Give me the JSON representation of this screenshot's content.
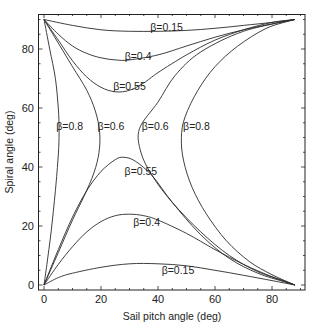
{
  "chart_data": {
    "type": "line",
    "title": "",
    "xlabel": "Sail pitch angle (deg)",
    "ylabel": "Spiral angle (deg)",
    "xlim": [
      0,
      90
    ],
    "ylim": [
      0,
      90
    ],
    "xticks": [
      0,
      20,
      40,
      60,
      80
    ],
    "yticks": [
      0,
      20,
      40,
      60,
      80
    ],
    "grid": false,
    "legend": "inline curve labels",
    "series": [
      {
        "name": "β=0.15 (upper)",
        "points": [
          [
            0,
            90
          ],
          [
            10,
            88
          ],
          [
            20,
            86.5
          ],
          [
            30,
            86
          ],
          [
            40,
            86
          ],
          [
            50,
            86.3
          ],
          [
            60,
            87
          ],
          [
            70,
            88
          ],
          [
            80,
            89
          ],
          [
            88,
            90
          ]
        ]
      },
      {
        "name": "β=0.4 (upper)",
        "points": [
          [
            0,
            90
          ],
          [
            5,
            85
          ],
          [
            10,
            81
          ],
          [
            15,
            78.5
          ],
          [
            20,
            77
          ],
          [
            25,
            76.3
          ],
          [
            30,
            76.3
          ],
          [
            40,
            78
          ],
          [
            50,
            81
          ],
          [
            60,
            84
          ],
          [
            70,
            86.5
          ],
          [
            80,
            88.5
          ],
          [
            88,
            90
          ]
        ]
      },
      {
        "name": "β=0.55 (upper)",
        "points": [
          [
            0,
            90
          ],
          [
            5,
            83
          ],
          [
            10,
            76
          ],
          [
            15,
            70.5
          ],
          [
            20,
            67
          ],
          [
            25,
            65.5
          ],
          [
            30,
            66
          ],
          [
            35,
            68.5
          ],
          [
            40,
            72
          ],
          [
            50,
            78
          ],
          [
            60,
            83
          ],
          [
            70,
            86.5
          ],
          [
            80,
            89
          ],
          [
            88,
            90
          ]
        ]
      },
      {
        "name": "β=0.6 (left)",
        "points": [
          [
            0,
            90
          ],
          [
            5,
            82
          ],
          [
            10,
            74
          ],
          [
            15,
            66
          ],
          [
            18,
            59
          ],
          [
            19.5,
            52
          ],
          [
            19.3,
            45
          ],
          [
            17.5,
            38
          ],
          [
            14,
            30
          ],
          [
            10,
            22
          ],
          [
            5,
            11
          ],
          [
            0,
            0
          ]
        ]
      },
      {
        "name": "β=0.8 (left)",
        "points": [
          [
            0,
            90
          ],
          [
            2,
            80
          ],
          [
            4,
            70
          ],
          [
            5,
            60
          ],
          [
            5.3,
            52
          ],
          [
            5,
            44
          ],
          [
            4,
            32
          ],
          [
            2.5,
            18
          ],
          [
            1,
            7
          ],
          [
            0,
            0
          ]
        ]
      },
      {
        "name": "β=0.6 (right)",
        "points": [
          [
            88,
            90
          ],
          [
            70,
            86
          ],
          [
            55,
            79
          ],
          [
            46,
            71
          ],
          [
            40,
            62
          ],
          [
            33.5,
            53
          ],
          [
            34,
            45
          ],
          [
            38,
            37
          ],
          [
            45,
            28
          ],
          [
            55,
            18
          ],
          [
            65,
            10
          ],
          [
            75,
            4.5
          ],
          [
            84,
            1.5
          ],
          [
            88,
            0
          ]
        ]
      },
      {
        "name": "β=0.8 (right)",
        "points": [
          [
            88,
            90
          ],
          [
            78,
            87
          ],
          [
            68,
            81
          ],
          [
            60,
            74
          ],
          [
            54,
            66
          ],
          [
            49.5,
            57
          ],
          [
            48.2,
            50
          ],
          [
            49,
            42
          ],
          [
            52,
            33
          ],
          [
            57,
            24
          ],
          [
            64,
            15
          ],
          [
            72,
            8
          ],
          [
            80,
            3.5
          ],
          [
            88,
            0
          ]
        ]
      },
      {
        "name": "β=0.55 (lower)",
        "points": [
          [
            0,
            0
          ],
          [
            5,
            12
          ],
          [
            10,
            23
          ],
          [
            15,
            32
          ],
          [
            20,
            38.5
          ],
          [
            25,
            42.5
          ],
          [
            28,
            43.3
          ],
          [
            32,
            42
          ],
          [
            38,
            37
          ],
          [
            45,
            28
          ],
          [
            55,
            17
          ],
          [
            65,
            9
          ],
          [
            75,
            4
          ],
          [
            84,
            1.2
          ],
          [
            88,
            0
          ]
        ]
      },
      {
        "name": "β=0.4 (lower)",
        "points": [
          [
            0,
            0
          ],
          [
            5,
            7
          ],
          [
            10,
            13
          ],
          [
            15,
            18
          ],
          [
            20,
            21.5
          ],
          [
            25,
            23.5
          ],
          [
            30,
            24
          ],
          [
            35,
            23.5
          ],
          [
            40,
            22
          ],
          [
            50,
            17.5
          ],
          [
            60,
            12
          ],
          [
            70,
            7
          ],
          [
            80,
            2.8
          ],
          [
            88,
            0
          ]
        ]
      },
      {
        "name": "β=0.15 (lower)",
        "points": [
          [
            0,
            0
          ],
          [
            5,
            2.5
          ],
          [
            10,
            4
          ],
          [
            20,
            6
          ],
          [
            30,
            7.2
          ],
          [
            40,
            7.2
          ],
          [
            50,
            6.5
          ],
          [
            60,
            5
          ],
          [
            70,
            3.3
          ],
          [
            80,
            1.5
          ],
          [
            88,
            0
          ]
        ]
      }
    ],
    "annotations": [
      {
        "text": "β=0.15",
        "x": 43,
        "y": 87.5
      },
      {
        "text": "β=0.4",
        "x": 33,
        "y": 77.5
      },
      {
        "text": "β=0.55",
        "x": 30,
        "y": 67.5
      },
      {
        "text": "β=0.8",
        "x": 9,
        "y": 54
      },
      {
        "text": "β=0.6",
        "x": 23.5,
        "y": 54
      },
      {
        "text": "β=0.6",
        "x": 39,
        "y": 54
      },
      {
        "text": "β=0.8",
        "x": 53.5,
        "y": 54
      },
      {
        "text": "β=0.55",
        "x": 34,
        "y": 38.5
      },
      {
        "text": "β=0.4",
        "x": 36,
        "y": 21.5
      },
      {
        "text": "β=0.15",
        "x": 47,
        "y": 5
      }
    ]
  },
  "axes": {
    "xlabel": "Sail pitch angle (deg)",
    "ylabel": "Spiral angle (deg)",
    "xtick_labels": [
      "0",
      "20",
      "40",
      "60",
      "80"
    ],
    "ytick_labels": [
      "0",
      "20",
      "40",
      "60",
      "80"
    ]
  },
  "colors": {
    "line": "#2a2a2a",
    "background": "#ffffff"
  }
}
